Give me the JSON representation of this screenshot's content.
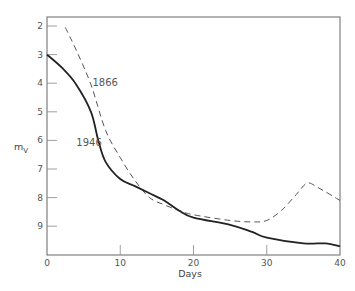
{
  "chart_data": {
    "type": "line",
    "title": "",
    "xlabel": "Days",
    "ylabel": "m_V",
    "ylabel_main": "m",
    "ylabel_sub": "V",
    "xlim": [
      0,
      40
    ],
    "ylim": [
      10,
      1.7
    ],
    "y_inverted": true,
    "grid": false,
    "x_ticks": [
      0,
      10,
      20,
      30,
      40
    ],
    "y_ticks": [
      2,
      3,
      4,
      5,
      6,
      7,
      8,
      9
    ],
    "series": [
      {
        "name": "1866",
        "style": "dashed",
        "color": "#555555",
        "label_pos": {
          "x": 6.2,
          "y": 4.1
        },
        "x": [
          2.5,
          4,
          6,
          8,
          10,
          12,
          14,
          16,
          18,
          20,
          25,
          28,
          30,
          32,
          34,
          35.5,
          37,
          40
        ],
        "y": [
          2.05,
          2.85,
          4.05,
          5.65,
          6.6,
          7.4,
          8.0,
          8.25,
          8.45,
          8.6,
          8.8,
          8.85,
          8.8,
          8.45,
          7.9,
          7.5,
          7.65,
          8.1
        ]
      },
      {
        "name": "1946",
        "style": "solid",
        "color": "#222222",
        "label_pos": {
          "x": 4.0,
          "y": 6.2
        },
        "x": [
          0,
          2,
          4,
          6,
          7,
          8,
          10,
          12,
          14,
          16,
          18,
          20,
          25,
          28,
          30,
          35,
          38,
          40
        ],
        "y": [
          3.0,
          3.45,
          4.05,
          5.0,
          6.0,
          6.75,
          7.35,
          7.6,
          7.85,
          8.1,
          8.45,
          8.7,
          8.95,
          9.2,
          9.4,
          9.6,
          9.6,
          9.7
        ]
      }
    ]
  }
}
